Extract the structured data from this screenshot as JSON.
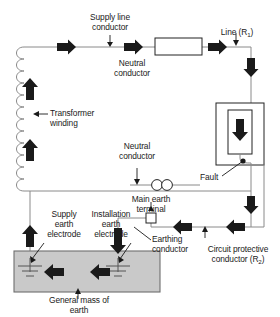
{
  "diagram": {
    "background_color": "#ffffff",
    "line_color": "#808080",
    "arrow_color": "#1a1a1a",
    "earth_block_fill": "#c8c8c8",
    "earth_block_stroke": "#707070",
    "labels": {
      "supply_line_conductor": "Supply line\nconductor",
      "line_r1": "Line (R",
      "line_r1_sub": "1",
      "line_r1_close": ")",
      "neutral_conductor_top": "Neutral\nconductor",
      "transformer_winding": "Transformer\nwinding",
      "neutral_conductor_mid": "Neutral\nconductor",
      "fault": "Fault",
      "main_earth_terminal": "Main earth\nterminal",
      "supply_earth_electrode": "Supply\nearth\nelectrode",
      "installation_earth_electrode": "Installation\nearth\nelectrode",
      "earthing_conductor": "Earthing\nconductor",
      "circuit_protective_conductor": "Circuit protective\nconductor (R",
      "cpc_sub": "2",
      "cpc_close": ")",
      "general_mass_of_earth": "General mass of\nearth"
    },
    "components": [
      {
        "name": "transformer-winding",
        "type": "coil",
        "loops": 8
      },
      {
        "name": "load-rectangle",
        "type": "rect"
      },
      {
        "name": "appliance-outer-box",
        "type": "rect"
      },
      {
        "name": "appliance-inner-box",
        "type": "rect"
      },
      {
        "name": "fault-point",
        "type": "dot"
      },
      {
        "name": "main-earth-terminal-symbol",
        "type": "double-circle"
      },
      {
        "name": "earthing-conductor-terminal",
        "type": "small-square"
      },
      {
        "name": "supply-earth-electrode-symbol",
        "type": "earth-symbol"
      },
      {
        "name": "installation-earth-electrode-symbol",
        "type": "earth-symbol"
      },
      {
        "name": "general-mass-of-earth-block",
        "type": "filled-rect"
      }
    ],
    "current_flow_arrows": [
      {
        "name": "arrow-supply-line-1",
        "direction": "right"
      },
      {
        "name": "arrow-supply-line-2",
        "direction": "right"
      },
      {
        "name": "arrow-supply-line-3",
        "direction": "right"
      },
      {
        "name": "arrow-line-down-1",
        "direction": "down"
      },
      {
        "name": "arrow-appliance-down",
        "direction": "down"
      },
      {
        "name": "arrow-cpc-down",
        "direction": "down"
      },
      {
        "name": "arrow-cpc-left-1",
        "direction": "left"
      },
      {
        "name": "arrow-cpc-left-2",
        "direction": "left"
      },
      {
        "name": "arrow-installation-earth-down",
        "direction": "down"
      },
      {
        "name": "arrow-earth-mass-left-1",
        "direction": "left"
      },
      {
        "name": "arrow-earth-mass-left-2",
        "direction": "left"
      },
      {
        "name": "arrow-supply-earth-up",
        "direction": "up"
      },
      {
        "name": "arrow-winding-up-1",
        "direction": "up"
      },
      {
        "name": "arrow-winding-up-2",
        "direction": "up"
      }
    ]
  }
}
